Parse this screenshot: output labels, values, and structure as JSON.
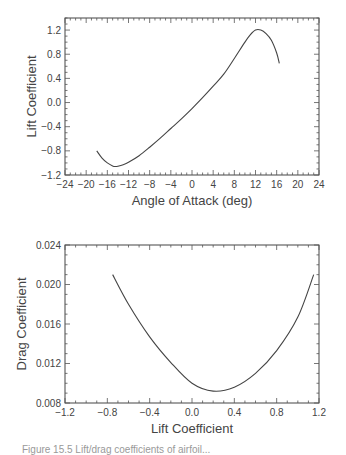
{
  "chart_data": [
    {
      "type": "line",
      "title": "",
      "xlabel": "Angle of Attack (deg)",
      "ylabel": "Lift Coefficient",
      "xlim": [
        -24,
        24
      ],
      "ylim": [
        -1.2,
        1.4
      ],
      "xticks": [
        "-24",
        "-20",
        "-16",
        "-12",
        "-8",
        "-4",
        "0",
        "4",
        "8",
        "12",
        "16",
        "20",
        "24"
      ],
      "yticks": [
        "-1.2",
        "-0.8",
        "-0.4",
        "0.0",
        "0.4",
        "0.8",
        "1.2"
      ],
      "grid": false,
      "series": [
        {
          "name": "CL vs alpha",
          "x": [
            -18,
            -17,
            -16,
            -15,
            -14.5,
            -14,
            -13,
            -12,
            -10,
            -8,
            -6,
            -4,
            -2,
            0,
            2,
            4,
            6,
            8,
            10,
            11,
            12,
            13,
            14,
            15,
            16,
            16.5
          ],
          "y": [
            -0.8,
            -0.92,
            -1.0,
            -1.05,
            -1.06,
            -1.055,
            -1.03,
            -0.99,
            -0.88,
            -0.74,
            -0.59,
            -0.43,
            -0.27,
            -0.1,
            0.08,
            0.27,
            0.47,
            0.73,
            1.0,
            1.12,
            1.2,
            1.2,
            1.14,
            1.03,
            0.82,
            0.65
          ]
        }
      ]
    },
    {
      "type": "line",
      "title": "",
      "xlabel": "Lift Coefficient",
      "ylabel": "Drag Coefficient",
      "xlim": [
        -1.2,
        1.2
      ],
      "ylim": [
        0.008,
        0.024
      ],
      "xticks": [
        "-1.2",
        "-0.8",
        "-0.4",
        "0.0",
        "0.4",
        "0.8",
        "1.2"
      ],
      "yticks": [
        "0.008",
        "0.012",
        "0.016",
        "0.020",
        "0.024"
      ],
      "grid": false,
      "series": [
        {
          "name": "Drag polar",
          "x": [
            -0.75,
            -0.6,
            -0.4,
            -0.2,
            0.0,
            0.2,
            0.4,
            0.6,
            0.8,
            1.0,
            1.15
          ],
          "y": [
            0.021,
            0.018,
            0.0147,
            0.0121,
            0.01,
            0.0092,
            0.0096,
            0.011,
            0.0133,
            0.0167,
            0.021
          ]
        }
      ]
    }
  ],
  "caption": "Figure 15.5 Lift/drag coefficients of airfoil..."
}
